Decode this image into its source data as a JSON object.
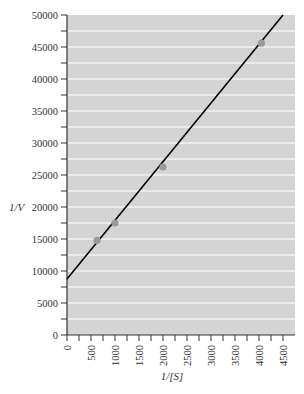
{
  "chart_data": {
    "type": "scatter",
    "title": "",
    "xlabel": "1/[S]",
    "ylabel": "1/V",
    "xlim": [
      0,
      4600
    ],
    "ylim": [
      0,
      50000
    ],
    "x_ticks": [
      0,
      500,
      1000,
      1500,
      2000,
      2500,
      3000,
      3500,
      4000,
      4500
    ],
    "y_ticks": [
      0,
      5000,
      10000,
      15000,
      20000,
      25000,
      30000,
      35000,
      40000,
      45000,
      50000
    ],
    "grid": true,
    "series": [
      {
        "name": "data",
        "type": "scatter",
        "color": "#9a9a9a",
        "points": [
          {
            "x": 625,
            "y": 14800
          },
          {
            "x": 1000,
            "y": 17500
          },
          {
            "x": 2000,
            "y": 26250
          },
          {
            "x": 4050,
            "y": 45600
          }
        ]
      },
      {
        "name": "fit",
        "type": "line",
        "color": "#000000",
        "points": [
          {
            "x": 0,
            "y": 8750
          },
          {
            "x": 4500,
            "y": 50000
          }
        ]
      }
    ]
  },
  "colors": {
    "plot_bg": "#d4d4d4",
    "grid": "#ffffff",
    "axis": "#333333"
  }
}
